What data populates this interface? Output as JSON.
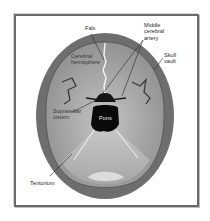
{
  "diagram": {
    "type": "anatomical-illustration",
    "labels": {
      "falx": "Falx",
      "middle_cerebral_artery": "Middle\ncerebral\nartery",
      "cerebral_hemisphere": "Cerebral\nhemisphere",
      "skull_vault": "Skull\nvault",
      "suprasellar_cistern": "Suprasellar\ncistern",
      "pons": "Pons",
      "tentorium": "Tentorium"
    },
    "colors": {
      "skull": "#6e6e6e",
      "brain": "#9a9a9a",
      "posterior_fossa": "#b8b8b8",
      "pons": "#0a0a0a",
      "frame": "#6a6a6a"
    }
  }
}
